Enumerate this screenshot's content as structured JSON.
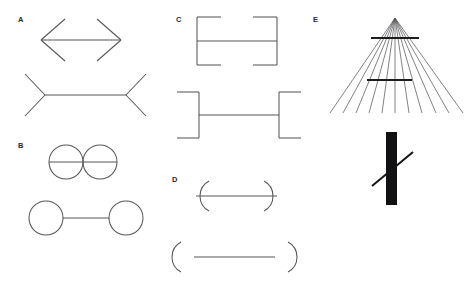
{
  "figure": {
    "background_color": "#ffffff",
    "line_color": "#56565a",
    "solid_color": "#111114",
    "width": 473,
    "height": 285
  },
  "panels": [
    {
      "id": "A",
      "label": "A",
      "label_x": 18,
      "label_y": 22,
      "name": "muller-lyer-arrowheads",
      "figures": [
        {
          "name": "outward-arrowheads",
          "description": "Horizontal shaft with outward pointing arrowheads",
          "shaft": {
            "x1": 41,
            "y1": 40,
            "x2": 121,
            "y2": 40
          },
          "fins": [
            {
              "x1": 41,
              "y1": 40,
              "x2": 65,
              "y2": 19
            },
            {
              "x1": 41,
              "y1": 40,
              "x2": 65,
              "y2": 61
            },
            {
              "x1": 121,
              "y1": 40,
              "x2": 97,
              "y2": 19
            },
            {
              "x1": 121,
              "y1": 40,
              "x2": 97,
              "y2": 61
            }
          ]
        },
        {
          "name": "inward-arrowheads",
          "description": "Horizontal shaft with inward pointing fins",
          "shaft": {
            "x1": 45,
            "y1": 95,
            "x2": 126,
            "y2": 95
          },
          "fins": [
            {
              "x1": 45,
              "y1": 95,
              "x2": 25,
              "y2": 74
            },
            {
              "x1": 45,
              "y1": 95,
              "x2": 25,
              "y2": 116
            },
            {
              "x1": 126,
              "y1": 95,
              "x2": 146,
              "y2": 74
            },
            {
              "x1": 126,
              "y1": 95,
              "x2": 146,
              "y2": 116
            }
          ]
        }
      ]
    },
    {
      "id": "B",
      "label": "B",
      "label_x": 18,
      "label_y": 148,
      "name": "circles-with-connecting-line",
      "figures": [
        {
          "name": "tangent-circles",
          "description": "Two adjacent tangent circles with line through centers",
          "circles": [
            {
              "cx": 66,
              "cy": 162,
              "r": 17
            },
            {
              "cx": 100,
              "cy": 162,
              "r": 17
            }
          ],
          "line": {
            "x1": 49,
            "y1": 162,
            "x2": 117,
            "y2": 162
          }
        },
        {
          "name": "separated-circles",
          "description": "Two separated circles joined by a line",
          "circles": [
            {
              "cx": 46,
              "cy": 218,
              "r": 17
            },
            {
              "cx": 126,
              "cy": 218,
              "r": 17
            }
          ],
          "line": {
            "x1": 63,
            "y1": 218,
            "x2": 109,
            "y2": 218
          }
        }
      ]
    },
    {
      "id": "C",
      "label": "C",
      "label_x": 176,
      "label_y": 22,
      "name": "muller-lyer-square-brackets",
      "figures": [
        {
          "name": "inward-brackets",
          "description": "Square brackets with flanges facing inward",
          "shaft": {
            "x1": 197,
            "y1": 41,
            "x2": 277,
            "y2": 41
          },
          "verticals": [
            {
              "x1": 197,
              "y1": 17,
              "x2": 197,
              "y2": 65
            },
            {
              "x1": 277,
              "y1": 17,
              "x2": 277,
              "y2": 65
            }
          ],
          "flanges": [
            {
              "x1": 197,
              "y1": 17,
              "x2": 221,
              "y2": 17
            },
            {
              "x1": 197,
              "y1": 65,
              "x2": 221,
              "y2": 65
            },
            {
              "x1": 277,
              "y1": 17,
              "x2": 253,
              "y2": 17
            },
            {
              "x1": 277,
              "y1": 65,
              "x2": 253,
              "y2": 65
            }
          ]
        },
        {
          "name": "outward-brackets",
          "description": "Square brackets with flanges facing outward",
          "shaft": {
            "x1": 199,
            "y1": 115,
            "x2": 279,
            "y2": 115
          },
          "verticals": [
            {
              "x1": 199,
              "y1": 92,
              "x2": 199,
              "y2": 138
            },
            {
              "x1": 279,
              "y1": 92,
              "x2": 279,
              "y2": 138
            }
          ],
          "flanges": [
            {
              "x1": 199,
              "y1": 92,
              "x2": 177,
              "y2": 92
            },
            {
              "x1": 199,
              "y1": 138,
              "x2": 177,
              "y2": 138
            },
            {
              "x1": 279,
              "y1": 92,
              "x2": 301,
              "y2": 92
            },
            {
              "x1": 279,
              "y1": 138,
              "x2": 301,
              "y2": 138
            }
          ]
        }
      ]
    },
    {
      "id": "D",
      "label": "D",
      "label_x": 172,
      "label_y": 182,
      "name": "muller-lyer-curved-brackets",
      "figures": [
        {
          "name": "inward-arcs",
          "description": "Horizontal line ending in inward facing curved brackets",
          "shaft": {
            "x1": 196,
            "y1": 196,
            "x2": 277,
            "y2": 196
          },
          "arcs": [
            {
              "cx": 196,
              "cy": 196,
              "r": 17,
              "facing": "right"
            },
            {
              "cx": 277,
              "cy": 196,
              "r": 17,
              "facing": "left"
            }
          ]
        },
        {
          "name": "outward-arcs",
          "description": "Horizontal line ending in outward facing curved brackets",
          "shaft": {
            "x1": 194,
            "y1": 257,
            "x2": 275,
            "y2": 257
          },
          "arcs": [
            {
              "cx": 194,
              "cy": 257,
              "r": 17,
              "facing": "left"
            },
            {
              "cx": 275,
              "cy": 257,
              "r": 17,
              "facing": "right"
            }
          ]
        }
      ]
    },
    {
      "id": "E",
      "label": "E",
      "label_x": 313,
      "label_y": 22,
      "name": "ponzo-and-poggendorff",
      "figures": [
        {
          "name": "ponzo-converging-rays",
          "description": "Fan of converging rays from an apex with two horizontal test bars",
          "apex": {
            "x": 395,
            "y": 18
          },
          "ray_count": 11,
          "ray_bottom_y": 113,
          "ray_bottom_x_start": 330,
          "ray_bottom_x_end": 463,
          "bars": [
            {
              "x1": 371,
              "y1": 38,
              "x2": 419,
              "y2": 38,
              "name": "upper-bar"
            },
            {
              "x1": 367,
              "y1": 80,
              "x2": 412,
              "y2": 80,
              "name": "lower-bar"
            }
          ]
        },
        {
          "name": "poggendorff",
          "description": "Thick vertical black bar crossed by an oblique line",
          "bar": {
            "x": 386,
            "y": 132,
            "width": 11,
            "height": 73
          },
          "oblique": {
            "x1": 372,
            "y1": 186,
            "x2": 413,
            "y2": 152
          }
        }
      ]
    }
  ]
}
